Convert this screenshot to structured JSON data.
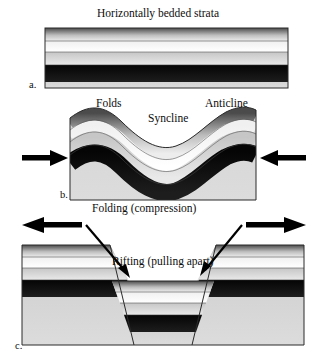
{
  "figure": {
    "background_color": "#ffffff",
    "width": 326,
    "height": 362
  },
  "panels": [
    {
      "tag": "a.",
      "heading": "Horizontally bedded strata",
      "caption": "",
      "description": "Undeformed flat-lying sedimentary layers",
      "arrows": []
    },
    {
      "tag": "b.",
      "heading": "",
      "caption": "Folding (compression)",
      "description": "Strata buckled into anticlines and synclines by horizontal compression",
      "labels": [
        {
          "name": "folds",
          "text": "Folds"
        },
        {
          "name": "anticline",
          "text": "Anticline"
        },
        {
          "name": "syncline",
          "text": "Syncline"
        }
      ],
      "arrows": [
        {
          "name": "compression-arrow-left",
          "direction": "right"
        },
        {
          "name": "compression-arrow-right",
          "direction": "left"
        }
      ]
    },
    {
      "tag": "c.",
      "heading": "",
      "caption": "Rifting (pulling apart)",
      "description": "Central graben block dropped down between two normal faults under extension",
      "arrows": [
        {
          "name": "extension-arrow-left",
          "direction": "left"
        },
        {
          "name": "extension-arrow-right",
          "direction": "right"
        },
        {
          "name": "fault-arrow-left",
          "direction": "down-right"
        },
        {
          "name": "fault-arrow-right",
          "direction": "down-left"
        }
      ]
    }
  ],
  "strata": {
    "layer_names": [
      "shale-top-unit",
      "light-sandstone-unit",
      "pale-limestone-unit",
      "dark-coal-unit",
      "basal-grey-unit"
    ],
    "colors": {
      "layer1_dark": "#4b4b4b",
      "layer1_light": "#e8e8e8",
      "layer2_dark": "#f2f2f2",
      "layer2_light": "#ffffff",
      "layer3_dark": "#c9c9c9",
      "layer3_light": "#e6e6e6",
      "layer4_dark": "#060606",
      "layer4_light": "#1a1a1a",
      "layer5_flat": "#d6d6d6",
      "outline": "#222222",
      "arrow_fill": "#000000"
    }
  },
  "colors": {
    "accent": "#000000",
    "page_background": "#ffffff",
    "text": "#0d0d0d"
  }
}
